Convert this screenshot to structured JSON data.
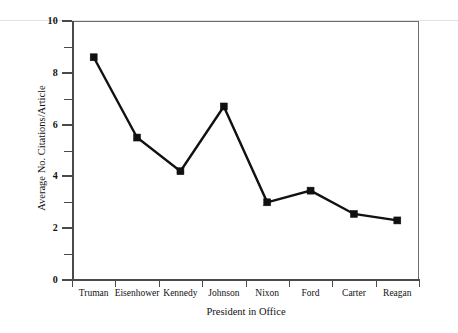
{
  "chart_data": {
    "type": "line",
    "title": "",
    "xlabel": "President in Office",
    "ylabel": "Average No. Citations/Article",
    "categories": [
      "Truman",
      "Eisenhower",
      "Kennedy",
      "Johnson",
      "Nixon",
      "Ford",
      "Carter",
      "Reagan"
    ],
    "values": [
      8.6,
      5.5,
      4.2,
      6.7,
      3.0,
      3.45,
      2.55,
      2.3
    ],
    "series": [
      {
        "name": "Average No. Citations/Article",
        "values": [
          8.6,
          5.5,
          4.2,
          6.7,
          3.0,
          3.45,
          2.55,
          2.3
        ]
      }
    ],
    "ylim": [
      0,
      10
    ],
    "ytick_labels": [
      "0",
      "2",
      "4",
      "6",
      "8",
      "10"
    ],
    "ytick_values": [
      0,
      2,
      4,
      6,
      8,
      10
    ],
    "yminor_ticks": [
      1,
      3,
      5,
      7,
      9
    ],
    "grid": false,
    "legend": false,
    "legend_position": "none",
    "marker": "square",
    "line_color": "#111111",
    "marker_color": "#111111",
    "axis_color": "#4a4a4a",
    "background_color": "#ffffff"
  },
  "figure": {
    "caption": ""
  }
}
